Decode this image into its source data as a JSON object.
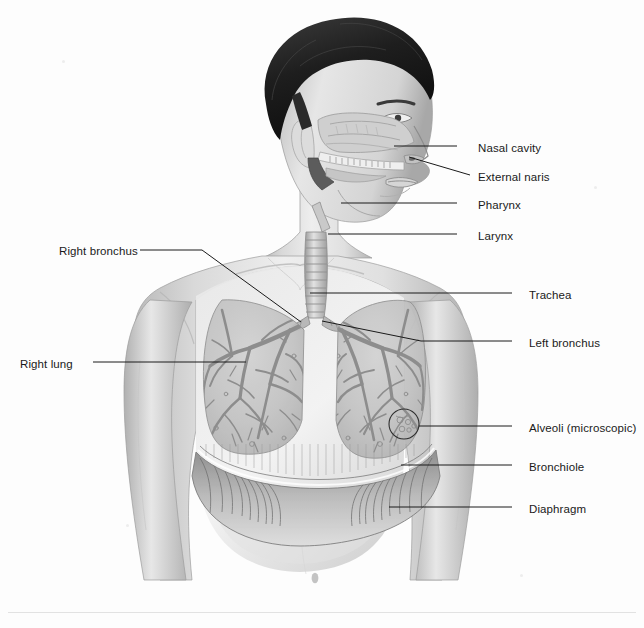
{
  "figure": {
    "view": "anterior torso with sagittal head cutaway",
    "style": "grayscale pencil/airbrush medical illustration",
    "background_color": "#fdfdfd",
    "line_color": "#1a1a1a",
    "text_color": "#1a1a1a"
  },
  "labels": [
    {
      "id": "nasal-cavity",
      "text": "Nasal cavity",
      "side": "right",
      "x": 478,
      "y": 142
    },
    {
      "id": "external-naris",
      "text": "External naris",
      "side": "right",
      "x": 478,
      "y": 171
    },
    {
      "id": "pharynx",
      "text": "Pharynx",
      "side": "right",
      "x": 478,
      "y": 199
    },
    {
      "id": "larynx",
      "text": "Larynx",
      "side": "right",
      "x": 478,
      "y": 230
    },
    {
      "id": "trachea",
      "text": "Trachea",
      "side": "right",
      "x": 529,
      "y": 289
    },
    {
      "id": "left-bronchus",
      "text": "Left bronchus",
      "side": "right",
      "x": 529,
      "y": 337
    },
    {
      "id": "alveoli",
      "text": "Alveoli (microscopic)",
      "side": "right",
      "x": 529,
      "y": 422
    },
    {
      "id": "bronchiole",
      "text": "Bronchiole",
      "side": "right",
      "x": 529,
      "y": 461
    },
    {
      "id": "diaphragm",
      "text": "Diaphragm",
      "side": "right",
      "x": 529,
      "y": 503
    },
    {
      "id": "right-bronchus",
      "text": "Right bronchus",
      "side": "left",
      "x": 59,
      "y": 245
    },
    {
      "id": "right-lung",
      "text": "Right lung",
      "side": "left",
      "x": 20,
      "y": 358
    }
  ],
  "leader_lines": [
    {
      "id": "leader-nasal-cavity",
      "points": "457,146 394,146"
    },
    {
      "id": "leader-external-naris",
      "points": "470,175 409,157"
    },
    {
      "id": "leader-pharynx",
      "points": "457,203 341,203"
    },
    {
      "id": "leader-larynx",
      "points": "457,234 328,234"
    },
    {
      "id": "leader-trachea",
      "points": "512,293 310,293"
    },
    {
      "id": "leader-left-bronchus",
      "points": "512,341 421,341 322,321"
    },
    {
      "id": "leader-alveoli",
      "points": "512,426 419,426"
    },
    {
      "id": "leader-bronchiole",
      "points": "512,465 401,465"
    },
    {
      "id": "leader-diaphragm",
      "points": "512,507 389,507"
    },
    {
      "id": "leader-right-bronchus",
      "points": "140,250 202,250 301,322"
    },
    {
      "id": "leader-right-lung",
      "points": "93,362 246,362"
    }
  ],
  "anatomy_parts": [
    {
      "id": "hair",
      "name": "Hair"
    },
    {
      "id": "head",
      "name": "Head (sagittal cutaway)"
    },
    {
      "id": "nasal-cavity",
      "name": "Nasal cavity"
    },
    {
      "id": "external-naris",
      "name": "External naris"
    },
    {
      "id": "pharynx",
      "name": "Pharynx"
    },
    {
      "id": "larynx",
      "name": "Larynx"
    },
    {
      "id": "trachea",
      "name": "Trachea"
    },
    {
      "id": "right-bronchus",
      "name": "Right bronchus"
    },
    {
      "id": "left-bronchus",
      "name": "Left bronchus"
    },
    {
      "id": "right-lung",
      "name": "Right lung"
    },
    {
      "id": "left-lung",
      "name": "Left lung"
    },
    {
      "id": "bronchiole",
      "name": "Bronchiole"
    },
    {
      "id": "alveoli",
      "name": "Alveoli (microscopic)"
    },
    {
      "id": "diaphragm",
      "name": "Diaphragm"
    },
    {
      "id": "torso",
      "name": "Torso"
    },
    {
      "id": "arms",
      "name": "Arms"
    }
  ],
  "footer": {
    "rule": true
  }
}
